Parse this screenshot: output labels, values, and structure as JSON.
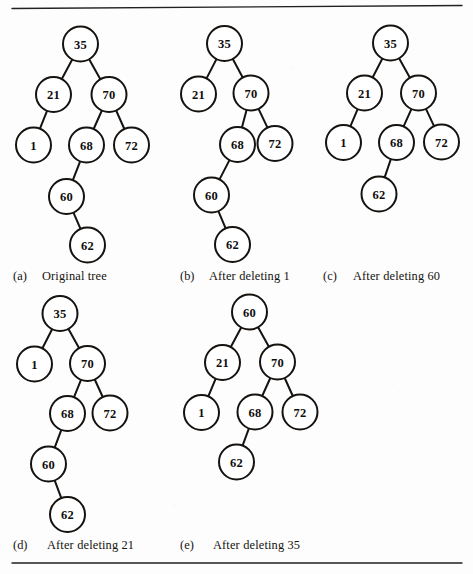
{
  "figure": {
    "background_color": "#fdfdfd",
    "ink_color": "#15120f",
    "node_radius": 17.5,
    "rules": [
      {
        "name": "top-rule",
        "x1": 12,
        "y1": 8.5,
        "x2": 462,
        "y2": 5.5
      },
      {
        "name": "bottom-rule",
        "x1": 12,
        "y1": 563,
        "x2": 462,
        "y2": 563
      }
    ]
  },
  "panels": [
    {
      "id": "a",
      "caption_tag": "(a)",
      "caption_text": "Original tree",
      "caption_tag_x": 13,
      "caption_text_x": 42,
      "caption_y": 280,
      "nodes": [
        {
          "id": "a35",
          "label": "35",
          "x": 80.5,
          "y": 44
        },
        {
          "id": "a21",
          "label": "21",
          "x": 53.5,
          "y": 94.5
        },
        {
          "id": "a70",
          "label": "70",
          "x": 109,
          "y": 94.5
        },
        {
          "id": "a1",
          "label": "1",
          "x": 33.5,
          "y": 145
        },
        {
          "id": "a68",
          "label": "68",
          "x": 86.5,
          "y": 145
        },
        {
          "id": "a72",
          "label": "72",
          "x": 131.5,
          "y": 145
        },
        {
          "id": "a60",
          "label": "60",
          "x": 66.5,
          "y": 196.5
        },
        {
          "id": "a62",
          "label": "62",
          "x": 87.5,
          "y": 245
        }
      ],
      "edges": [
        [
          "a35",
          "a21"
        ],
        [
          "a35",
          "a70"
        ],
        [
          "a21",
          "a1"
        ],
        [
          "a70",
          "a68"
        ],
        [
          "a70",
          "a72"
        ],
        [
          "a68",
          "a60"
        ],
        [
          "a60",
          "a62"
        ]
      ]
    },
    {
      "id": "b",
      "caption_tag": "(b)",
      "caption_text": "After deleting 1",
      "caption_tag_x": 180,
      "caption_text_x": 209,
      "caption_y": 280,
      "nodes": [
        {
          "id": "b35",
          "label": "35",
          "x": 224.5,
          "y": 43.5
        },
        {
          "id": "b21",
          "label": "21",
          "x": 198.5,
          "y": 94
        },
        {
          "id": "b70",
          "label": "70",
          "x": 251,
          "y": 93
        },
        {
          "id": "b68",
          "label": "68",
          "x": 237.5,
          "y": 144.5
        },
        {
          "id": "b72",
          "label": "72",
          "x": 275,
          "y": 143.5
        },
        {
          "id": "b60",
          "label": "60",
          "x": 211.5,
          "y": 195
        },
        {
          "id": "b62",
          "label": "62",
          "x": 232.5,
          "y": 244.5
        }
      ],
      "edges": [
        [
          "b35",
          "b21"
        ],
        [
          "b35",
          "b70"
        ],
        [
          "b70",
          "b68"
        ],
        [
          "b70",
          "b72"
        ],
        [
          "b68",
          "b60"
        ],
        [
          "b60",
          "b62"
        ]
      ]
    },
    {
      "id": "c",
      "caption_tag": "(c)",
      "caption_text": "After deleting 60",
      "caption_tag_x": 323,
      "caption_text_x": 353,
      "caption_y": 280,
      "nodes": [
        {
          "id": "c35",
          "label": "35",
          "x": 390.5,
          "y": 43
        },
        {
          "id": "c21",
          "label": "21",
          "x": 364.5,
          "y": 93
        },
        {
          "id": "c70",
          "label": "70",
          "x": 418.5,
          "y": 93
        },
        {
          "id": "c1",
          "label": "1",
          "x": 343.5,
          "y": 142.5
        },
        {
          "id": "c68",
          "label": "68",
          "x": 396.5,
          "y": 142.5
        },
        {
          "id": "c72",
          "label": "72",
          "x": 441.5,
          "y": 142
        },
        {
          "id": "c62",
          "label": "62",
          "x": 379,
          "y": 194
        }
      ],
      "edges": [
        [
          "c35",
          "c21"
        ],
        [
          "c35",
          "c70"
        ],
        [
          "c21",
          "c1"
        ],
        [
          "c70",
          "c68"
        ],
        [
          "c70",
          "c72"
        ],
        [
          "c68",
          "c62"
        ]
      ]
    },
    {
      "id": "d",
      "caption_tag": "(d)",
      "caption_text": "After deleting 21",
      "caption_tag_x": 13,
      "caption_text_x": 47,
      "caption_y": 549,
      "nodes": [
        {
          "id": "d35",
          "label": "35",
          "x": 60,
          "y": 313.5
        },
        {
          "id": "d1",
          "label": "1",
          "x": 34.5,
          "y": 364
        },
        {
          "id": "d70",
          "label": "70",
          "x": 87.5,
          "y": 363.5
        },
        {
          "id": "d68",
          "label": "68",
          "x": 67.5,
          "y": 413.5
        },
        {
          "id": "d72",
          "label": "72",
          "x": 110,
          "y": 413
        },
        {
          "id": "d60",
          "label": "60",
          "x": 48.5,
          "y": 464
        },
        {
          "id": "d62",
          "label": "62",
          "x": 67.5,
          "y": 514.5
        }
      ],
      "edges": [
        [
          "d35",
          "d1"
        ],
        [
          "d35",
          "d70"
        ],
        [
          "d70",
          "d68"
        ],
        [
          "d70",
          "d72"
        ],
        [
          "d68",
          "d60"
        ],
        [
          "d60",
          "d62"
        ]
      ]
    },
    {
      "id": "e",
      "caption_tag": "(e)",
      "caption_text": "After deleting 35",
      "caption_tag_x": 180,
      "caption_text_x": 213,
      "caption_y": 549,
      "nodes": [
        {
          "id": "e60",
          "label": "60",
          "x": 249.5,
          "y": 312
        },
        {
          "id": "e21",
          "label": "21",
          "x": 222.5,
          "y": 362.5
        },
        {
          "id": "e70",
          "label": "70",
          "x": 277.5,
          "y": 362
        },
        {
          "id": "e1",
          "label": "1",
          "x": 201.5,
          "y": 412.5
        },
        {
          "id": "e68",
          "label": "68",
          "x": 255,
          "y": 412
        },
        {
          "id": "e72",
          "label": "72",
          "x": 300,
          "y": 412
        },
        {
          "id": "e62",
          "label": "62",
          "x": 236.5,
          "y": 462
        }
      ],
      "edges": [
        [
          "e60",
          "e21"
        ],
        [
          "e60",
          "e70"
        ],
        [
          "e21",
          "e1"
        ],
        [
          "e70",
          "e68"
        ],
        [
          "e70",
          "e72"
        ],
        [
          "e68",
          "e62"
        ]
      ]
    }
  ]
}
